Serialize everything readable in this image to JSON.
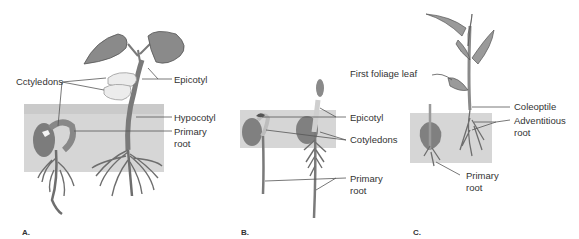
{
  "figure": {
    "panels": [
      {
        "id": "A",
        "letter": "A.",
        "labels": {
          "cotyledons": "Cctyledons",
          "epicotyl": "Epicotyl",
          "hypocotyl": "Hypocotyl",
          "primary_root_line1": "Primary",
          "primary_root_line2": "root"
        }
      },
      {
        "id": "B",
        "letter": "B.",
        "labels": {
          "epicotyl": "Epicotyl",
          "cotyledons": "Cotyledons",
          "primary_root_line1": "Primary",
          "primary_root_line2": "root"
        }
      },
      {
        "id": "C",
        "letter": "C.",
        "labels": {
          "first_foliage_leaf": "First foliage leaf",
          "coleoptile": "Coleoptile",
          "adventitious_root_line1": "Adventitious",
          "adventitious_root_line2": "root",
          "primary_root_line1": "Primary",
          "primary_root_line2": "root"
        }
      }
    ],
    "colors": {
      "soil": "#d4d4d4",
      "plant_dark": "#7a7a7a",
      "plant_mid": "#9a9a9a",
      "cotyledon_light": "#ececec",
      "leader_line": "#555555",
      "text": "#333333"
    }
  }
}
